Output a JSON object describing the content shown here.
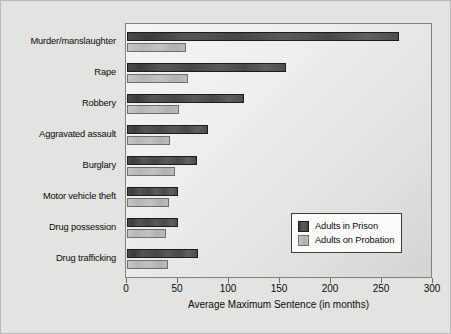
{
  "chart_data": {
    "type": "bar",
    "orientation": "horizontal",
    "title": "",
    "xlabel": "Average Maximum Sentence (in months)",
    "ylabel": "",
    "xlim": [
      0,
      300
    ],
    "xticks": [
      0,
      50,
      100,
      150,
      200,
      250,
      300
    ],
    "grid": false,
    "legend_position": "lower-right",
    "categories": [
      "Murder/manslaughter",
      "Rape",
      "Robbery",
      "Aggravated assault",
      "Burglary",
      "Motor vehicle theft",
      "Drug possession",
      "Drug trafficking"
    ],
    "series": [
      {
        "name": "Adults in Prison",
        "color": "#4a4a4a",
        "values": [
          267,
          156,
          115,
          79,
          69,
          50,
          50,
          70
        ]
      },
      {
        "name": "Adults on Probation",
        "color": "#bdbdbb",
        "values": [
          58,
          60,
          51,
          42,
          47,
          41,
          38,
          40
        ]
      }
    ]
  },
  "legend": {
    "items": [
      {
        "label": "Adults in Prison",
        "swatch": "prison"
      },
      {
        "label": "Adults on Probation",
        "swatch": "probation"
      }
    ]
  }
}
